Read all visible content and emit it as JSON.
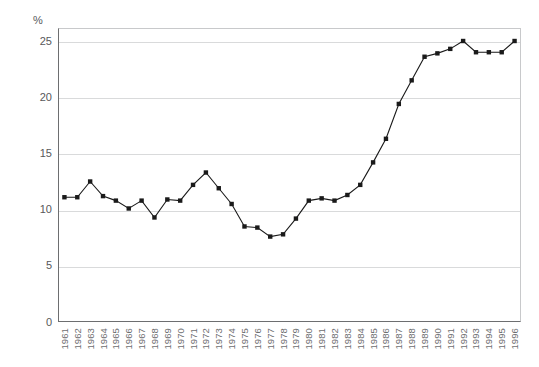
{
  "chart_data": {
    "type": "line",
    "title": "",
    "subtitle": "",
    "xlabel": "",
    "ylabel": "%",
    "y_unit_label": "%",
    "categories": [
      "1961",
      "1962",
      "1963",
      "1964",
      "1965",
      "1966",
      "1967",
      "1968",
      "1969",
      "1970",
      "1971",
      "1972",
      "1973",
      "1974",
      "1975",
      "1976",
      "1977",
      "1978",
      "1979",
      "1980",
      "1981",
      "1982",
      "1983",
      "1984",
      "1985",
      "1986",
      "1987",
      "1988",
      "1989",
      "1990",
      "1991",
      "1992",
      "1993",
      "1994",
      "1995",
      "1996"
    ],
    "values": [
      11.1,
      11.1,
      12.5,
      11.2,
      10.8,
      10.1,
      10.8,
      9.3,
      10.9,
      10.8,
      12.2,
      13.3,
      11.9,
      10.5,
      8.5,
      8.4,
      7.6,
      7.8,
      9.2,
      10.8,
      11.0,
      10.8,
      11.3,
      12.2,
      14.2,
      16.3,
      19.4,
      21.5,
      23.6,
      23.9,
      24.3,
      25.0,
      24.0,
      24.0,
      24.0,
      25.0
    ],
    "ylim": [
      0,
      25
    ],
    "yticks": [
      0,
      5,
      10,
      15,
      20,
      25
    ],
    "ytick_labels": [
      "0",
      "5",
      "10",
      "15",
      "20",
      "25"
    ],
    "xlim_labels": [
      "1961",
      "1996"
    ],
    "grid": true,
    "grid_axis": "y",
    "legend": false,
    "legend_position": "none",
    "marker": "square",
    "series": [
      {
        "name": "series-1",
        "color": "#1a1a1a",
        "values": [
          11.1,
          11.1,
          12.5,
          11.2,
          10.8,
          10.1,
          10.8,
          9.3,
          10.9,
          10.8,
          12.2,
          13.3,
          11.9,
          10.5,
          8.5,
          8.4,
          7.6,
          7.8,
          9.2,
          10.8,
          11.0,
          10.8,
          11.3,
          12.2,
          14.2,
          16.3,
          19.4,
          21.5,
          23.6,
          23.9,
          24.3,
          25.0,
          24.0,
          24.0,
          24.0,
          25.0
        ]
      }
    ],
    "colors": {
      "line": "#1a1a1a",
      "marker": "#1a1a1a",
      "grid": "#d9dadb",
      "axis": "#6d6e70",
      "tick_text": "#58585a",
      "xtick_text": "#6d6e70",
      "background": "#ffffff"
    }
  }
}
